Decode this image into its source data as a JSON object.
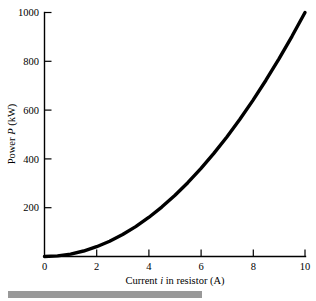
{
  "figure": {
    "background_color": "#ffffff",
    "ink_color": "#000000"
  },
  "chart_data": {
    "type": "line",
    "title": "",
    "subtitle": "",
    "xlabel_parts": {
      "before": "Current ",
      "variable": "i",
      "after": " in resistor (A)"
    },
    "xlabel": "Current i in resistor (A)",
    "ylabel_parts": {
      "before": "Power ",
      "variable": "P",
      "after": " (kW)"
    },
    "ylabel": "Power P (kW)",
    "xlim": [
      0,
      10
    ],
    "ylim": [
      0,
      1000
    ],
    "xticks": [
      0,
      2,
      4,
      6,
      8,
      10
    ],
    "xtick_labels": [
      "0",
      "2",
      "4",
      "6",
      "8",
      "10"
    ],
    "yticks": [
      0,
      200,
      400,
      600,
      800,
      1000
    ],
    "ytick_labels": [
      "0",
      "200",
      "400",
      "600",
      "800",
      "1000"
    ],
    "ytick_labels_shown": [
      "200",
      "400",
      "600",
      "800",
      "1000"
    ],
    "grid": false,
    "legend": false,
    "legend_position": "none",
    "relation": "P = 10 i^2",
    "series": [
      {
        "name": "Power dissipated in resistor",
        "color": "#000000",
        "line_width": 3.4,
        "x": [
          0,
          0.5,
          1,
          1.5,
          2,
          2.5,
          3,
          3.5,
          4,
          4.5,
          5,
          5.5,
          6,
          6.5,
          7,
          7.5,
          8,
          8.5,
          9,
          9.5,
          10
        ],
        "values": [
          0,
          2.5,
          10,
          22.5,
          40,
          62.5,
          90,
          122.5,
          160,
          202.5,
          250,
          302.5,
          360,
          422.5,
          490,
          562.5,
          640,
          722.5,
          810,
          902.5,
          1000
        ]
      }
    ],
    "annotations": []
  },
  "footer": {
    "bar_color": "#999999",
    "label": "scan-artifact-bar"
  }
}
